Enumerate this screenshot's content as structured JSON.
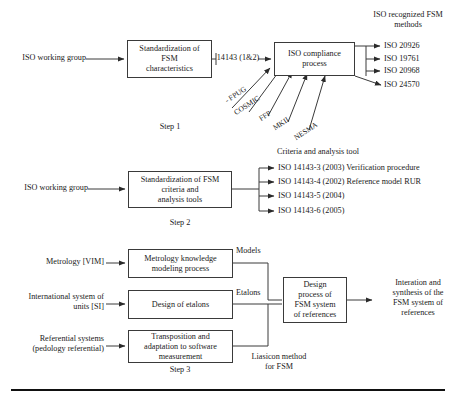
{
  "figure": {
    "bottom_rule": true
  },
  "step1": {
    "step_label": "Step 1",
    "source_label": "ISO working group",
    "box1": "Standardization of\nFSM\ncharacteristics",
    "link_label": "14143 (1&2)",
    "box2": "ISO compliance\nprocess",
    "inputs": [
      "- FPUG",
      "COSMIC",
      "FFP",
      "MKII",
      "NESMA"
    ],
    "outputs_header": "ISO recognized FSM\nmethods",
    "outputs": [
      "ISO 20926",
      "ISO 19761",
      "ISO 20968",
      "ISO 24570"
    ]
  },
  "step2": {
    "step_label": "Step 2",
    "source_label": "ISO working group",
    "box1": "Standardization of FSM\ncriteria and\nanalysis tools",
    "outputs_header": "Criteria and analysis tool",
    "outputs": [
      "ISO 14143-3 (2003) Verification procedure",
      "ISO 14143-4 (2002) Reference model RUR",
      "ISO 14143-5 (2004)",
      "ISO 14143-6 (2005)"
    ]
  },
  "step3": {
    "step_label": "Step 3",
    "sources": [
      "Metrology [VIM]",
      "International system of\nunits [SI]",
      "Referential systems\n(pedology referential)"
    ],
    "boxes": [
      "Metrology knowledge\nmodeling process",
      "Design of etalons",
      "Transposition and\nadaptation to software\nmeasurement"
    ],
    "edge_labels": [
      "Models",
      "Etalons",
      "Liasicon method\nfor FSM"
    ],
    "merge_box": "Design\nprocess of\nFSM system\nof references",
    "result": "Interation and\nsynthesis of the\nFSM system of\nreferences"
  },
  "colors": {
    "ink": "#1a1a1a",
    "line": "#3a3a3a",
    "rule": "#111111",
    "background": "#ffffff"
  }
}
